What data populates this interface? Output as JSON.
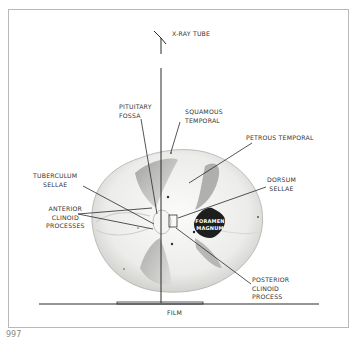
{
  "figure": {
    "number": "997",
    "labels": {
      "xray_tube": "X-RAY TUBE",
      "pituitary_fossa": "PITUITARY\nFOSSA",
      "squamous_temporal": "SQUAMOUS\nTEMPORAL",
      "petrous_temporal": "PETROUS TEMPORAL",
      "dorsum_sellae": "DORSUM\nSELLAE",
      "tuberculum_sellae": "TUBERCULUM\nSELLAE",
      "anterior_clinoid": "ANTERIOR\nCLINOID\nPROCESSES",
      "posterior_clinoid": "POSTERIOR\nCLINOID\nPROCESS",
      "foramen_magnum_1": "FORAMEN",
      "foramen_magnum_2": "MAGNUM",
      "film": "FILM"
    },
    "colors": {
      "line": "#2a2a2a",
      "skull_fill": "#f2f2f0",
      "skull_shadow": "#bdbdbd",
      "foramen": "#1e1e1e",
      "border": "#b8b8b8"
    }
  }
}
